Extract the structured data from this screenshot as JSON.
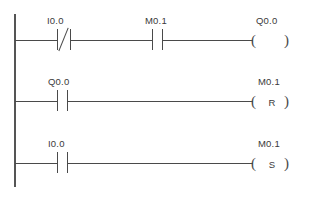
{
  "diagram": {
    "type": "plc-ladder-logic",
    "title": "",
    "colors": {
      "background": "#ffffff",
      "line": "#4a4a4a",
      "rail": "#555555",
      "text": "#3a3a3a"
    },
    "rungs": [
      {
        "id": "rung-1",
        "contacts": [
          {
            "label": "I0.0",
            "kind": "normally-closed"
          },
          {
            "label": "M0.1",
            "kind": "normally-open"
          }
        ],
        "coil": {
          "label": "Q0.0",
          "kind": "output",
          "letter": ""
        }
      },
      {
        "id": "rung-2",
        "contacts": [
          {
            "label": "Q0.0",
            "kind": "normally-open"
          }
        ],
        "coil": {
          "label": "M0.1",
          "kind": "reset",
          "letter": "R"
        }
      },
      {
        "id": "rung-3",
        "contacts": [
          {
            "label": "I0.0",
            "kind": "normally-open"
          }
        ],
        "coil": {
          "label": "M0.1",
          "kind": "set",
          "letter": "S"
        }
      }
    ]
  }
}
